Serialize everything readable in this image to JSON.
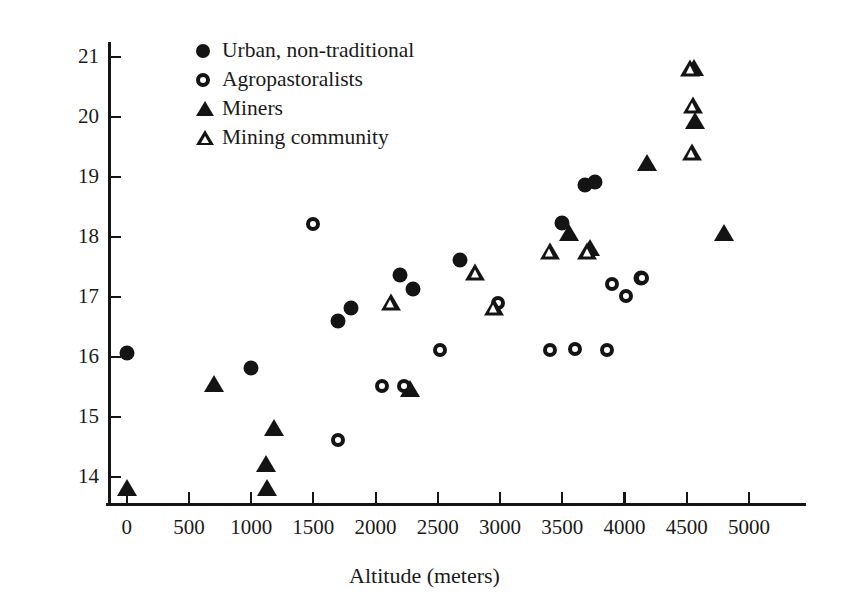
{
  "chart_data": {
    "type": "scatter",
    "title": "",
    "xlabel": "Altitude (meters)",
    "ylabel": "Hemoglobin Concentration (g/dl)",
    "xlim": [
      -150,
      5450
    ],
    "ylim": [
      13.55,
      21.2
    ],
    "xticks": [
      0,
      500,
      1000,
      1500,
      2000,
      2500,
      3000,
      3500,
      4000,
      4500,
      5000
    ],
    "xticklabels": [
      "0",
      "500",
      "1000",
      "1500",
      "2000",
      "2500",
      "3000",
      "3500",
      "4000",
      "4500",
      "5000"
    ],
    "yticks": [
      14,
      15,
      16,
      17,
      18,
      19,
      20,
      21
    ],
    "yticklabels": [
      "14",
      "15",
      "16",
      "17",
      "18",
      "19",
      "20",
      "21"
    ],
    "grid": false,
    "legend_position": "upper left inside",
    "marker_color": "#141414",
    "series": [
      {
        "name": "Urban, non-traditional",
        "marker": "filled-circle",
        "points": [
          [
            0,
            16.05
          ],
          [
            1000,
            15.8
          ],
          [
            1700,
            16.58
          ],
          [
            1800,
            16.8
          ],
          [
            2200,
            17.35
          ],
          [
            2300,
            17.12
          ],
          [
            2680,
            17.6
          ],
          [
            3500,
            18.22
          ],
          [
            3680,
            18.85
          ],
          [
            3760,
            18.9
          ],
          [
            4130,
            17.3
          ]
        ]
      },
      {
        "name": "Agropastoralists",
        "marker": "open-circle",
        "points": [
          [
            1500,
            18.2
          ],
          [
            1700,
            14.6
          ],
          [
            2050,
            15.5
          ],
          [
            2230,
            15.5
          ],
          [
            2520,
            16.1
          ],
          [
            2980,
            16.88
          ],
          [
            3400,
            16.1
          ],
          [
            3600,
            16.12
          ],
          [
            3860,
            16.1
          ],
          [
            3900,
            17.2
          ],
          [
            4010,
            17.0
          ],
          [
            4140,
            17.3
          ]
        ]
      },
      {
        "name": "Miners",
        "marker": "filled-triangle",
        "points": [
          [
            0,
            13.8
          ],
          [
            700,
            15.53
          ],
          [
            1120,
            14.2
          ],
          [
            1130,
            13.8
          ],
          [
            1180,
            14.8
          ],
          [
            2280,
            15.45
          ],
          [
            3550,
            18.05
          ],
          [
            3720,
            17.8
          ],
          [
            4180,
            19.22
          ],
          [
            4560,
            20.8
          ],
          [
            4570,
            19.92
          ],
          [
            4800,
            18.05
          ]
        ]
      },
      {
        "name": "Mining community",
        "marker": "open-triangle",
        "points": [
          [
            2120,
            16.9
          ],
          [
            2800,
            17.4
          ],
          [
            2950,
            16.82
          ],
          [
            3400,
            17.75
          ],
          [
            3700,
            17.75
          ],
          [
            4530,
            20.8
          ],
          [
            4550,
            20.18
          ],
          [
            4540,
            19.4
          ]
        ]
      }
    ]
  },
  "legend": {
    "items": [
      {
        "label": "Urban, non-traditional",
        "marker": "filled-circle"
      },
      {
        "label": "Agropastoralists",
        "marker": "open-circle"
      },
      {
        "label": "Miners",
        "marker": "filled-triangle"
      },
      {
        "label": "Mining community",
        "marker": "open-triangle"
      }
    ]
  }
}
